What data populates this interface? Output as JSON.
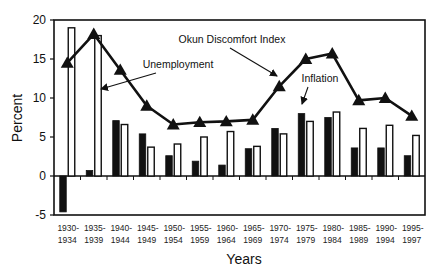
{
  "chart_data": {
    "type": "bar",
    "title": "",
    "xlabel": "Years",
    "ylabel": "Percent",
    "ylim": [
      -5,
      20
    ],
    "yticks": [
      -5,
      0,
      5,
      10,
      15,
      20
    ],
    "grid": false,
    "legend": "none (inline annotations with arrows)",
    "categories": [
      "1930-1934",
      "1935-1939",
      "1940-1944",
      "1945-1949",
      "1950-1954",
      "1955-1959",
      "1960-1964",
      "1965-1969",
      "1970-1974",
      "1975-1979",
      "1980-1984",
      "1985-1989",
      "1990-1994",
      "1995-1997"
    ],
    "category_lines": [
      [
        "1930-",
        "1934"
      ],
      [
        "1935-",
        "1939"
      ],
      [
        "1940-",
        "1944"
      ],
      [
        "1945-",
        "1949"
      ],
      [
        "1950-",
        "1954"
      ],
      [
        "1955-",
        "1959"
      ],
      [
        "1960-",
        "1964"
      ],
      [
        "1965-",
        "1969"
      ],
      [
        "1970-",
        "1974"
      ],
      [
        "1975-",
        "1979"
      ],
      [
        "1980-",
        "1984"
      ],
      [
        "1985-",
        "1989"
      ],
      [
        "1990-",
        "1994"
      ],
      [
        "1995-",
        "1997"
      ]
    ],
    "series": [
      {
        "name": "Inflation",
        "type": "bar",
        "style": "solid-black",
        "values": [
          -4.6,
          0.7,
          7.1,
          5.4,
          2.6,
          1.9,
          1.4,
          3.5,
          6.1,
          8.0,
          7.5,
          3.6,
          3.6,
          2.6
        ]
      },
      {
        "name": "Unemployment",
        "type": "bar",
        "style": "hollow-white",
        "values": [
          19.0,
          18.0,
          6.6,
          3.7,
          4.1,
          5.0,
          5.7,
          3.8,
          5.4,
          7.0,
          8.2,
          6.1,
          6.5,
          5.2
        ]
      },
      {
        "name": "Okun Discomfort Index",
        "type": "line",
        "marker": "triangle",
        "values": [
          14.5,
          18.2,
          13.6,
          9.0,
          6.6,
          6.9,
          7.0,
          7.2,
          11.5,
          15.0,
          15.7,
          9.7,
          10.0,
          7.7
        ]
      }
    ],
    "annotations": [
      {
        "text": "Okun Discomfort Index"
      },
      {
        "text": "Unemployment"
      },
      {
        "text": "Inflation"
      }
    ]
  }
}
